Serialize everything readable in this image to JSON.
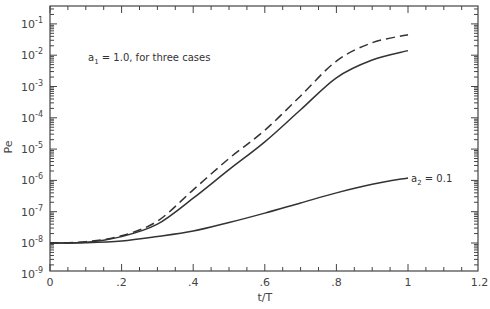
{
  "chart_data": {
    "type": "line",
    "title": "",
    "xlabel": "t/T",
    "ylabel": "Pe",
    "xlim": [
      0,
      1.2
    ],
    "ylim": [
      1e-09,
      0.3
    ],
    "yscale": "log",
    "grid": false,
    "x_ticks": [
      "0",
      ".2",
      ".4",
      ".6",
      ".8",
      "1",
      "1.2"
    ],
    "y_ticks": [
      {
        "base": "10",
        "exp": "-9"
      },
      {
        "base": "10",
        "exp": "-8"
      },
      {
        "base": "10",
        "exp": "-7"
      },
      {
        "base": "10",
        "exp": "-6"
      },
      {
        "base": "10",
        "exp": "-5"
      },
      {
        "base": "10",
        "exp": "-4"
      },
      {
        "base": "10",
        "exp": "-3"
      },
      {
        "base": "10",
        "exp": "-2"
      },
      {
        "base": "10",
        "exp": "-1"
      }
    ],
    "x": [
      0,
      0.1,
      0.2,
      0.3,
      0.4,
      0.5,
      0.6,
      0.7,
      0.8,
      0.9,
      1.0
    ],
    "series": [
      {
        "name": "a1 = 1.0 (dashed)",
        "style": "dashed",
        "values": [
          1e-08,
          1.1e-08,
          1.7e-08,
          5e-08,
          5e-07,
          5e-06,
          4e-05,
          0.0005,
          0.0065,
          0.025,
          0.045
        ]
      },
      {
        "name": "a1 = 1.0 (solid)",
        "style": "solid",
        "values": [
          1e-08,
          1.05e-08,
          1.6e-08,
          4e-08,
          2.7e-07,
          2.2e-06,
          1.7e-05,
          0.00018,
          0.0019,
          0.007,
          0.014
        ]
      },
      {
        "name": "a2 = 0.1",
        "style": "solid",
        "values": [
          1e-08,
          1.02e-08,
          1.15e-08,
          1.6e-08,
          2.4e-08,
          4.5e-08,
          9e-08,
          1.9e-07,
          4e-07,
          7.5e-07,
          1.2e-06
        ]
      }
    ],
    "annotations": [
      {
        "text_main": "a",
        "text_sub": "1",
        "text_rest": " = 1.0, for three cases"
      },
      {
        "text_main": "a",
        "text_sub": "2",
        "text_rest": " = 0.1"
      }
    ]
  }
}
